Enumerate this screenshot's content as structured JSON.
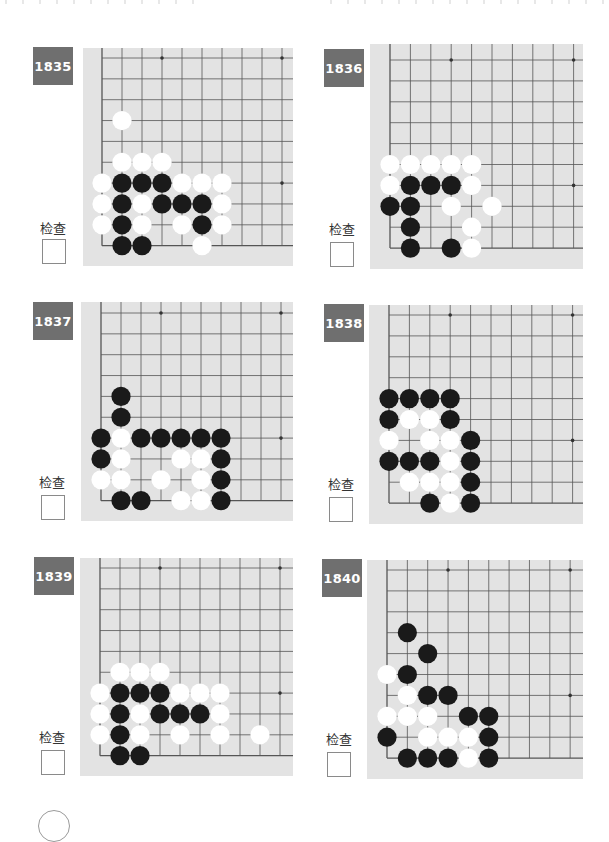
{
  "page": {
    "check_label": "检查",
    "colors": {
      "badge_bg": "#6f6f6f",
      "board_bg": "#e3e3e3",
      "grid_line": "#555555",
      "black_stone": "#1a1a1a",
      "white_stone": "#ffffff"
    }
  },
  "problems": [
    {
      "number": "1835",
      "check_label": "检查",
      "board": {
        "x": 83,
        "y": 48,
        "w": 210,
        "h": 218,
        "grid_left": 19,
        "grid_top": 10,
        "dx": 20,
        "dy": 20.85,
        "cols": 10,
        "rows": 10,
        "stars": [
          [
            3,
            0
          ],
          [
            9,
            0
          ],
          [
            9,
            6
          ]
        ]
      },
      "badge": {
        "x": 33,
        "y": 47
      },
      "label_pos": {
        "x": 33,
        "y": 218
      },
      "checkbox_pos": {
        "x": 42,
        "y": 239
      },
      "black": [
        [
          1,
          6
        ],
        [
          2,
          6
        ],
        [
          3,
          6
        ],
        [
          1,
          7
        ],
        [
          3,
          7
        ],
        [
          4,
          7
        ],
        [
          5,
          7
        ],
        [
          1,
          8
        ],
        [
          5,
          8
        ],
        [
          1,
          9
        ],
        [
          2,
          9
        ]
      ],
      "white": [
        [
          1,
          3
        ],
        [
          1,
          5
        ],
        [
          2,
          5
        ],
        [
          3,
          5
        ],
        [
          0,
          6
        ],
        [
          4,
          6
        ],
        [
          5,
          6
        ],
        [
          6,
          6
        ],
        [
          0,
          7
        ],
        [
          2,
          7
        ],
        [
          6,
          7
        ],
        [
          0,
          8
        ],
        [
          2,
          8
        ],
        [
          4,
          8
        ],
        [
          6,
          8
        ],
        [
          5,
          9
        ]
      ]
    },
    {
      "number": "1836",
      "check_label": "检查",
      "board": {
        "x": 370,
        "y": 44,
        "w": 213,
        "h": 225,
        "grid_left": 20,
        "grid_top": 16,
        "dx": 20.4,
        "dy": 20.9,
        "cols": 10,
        "rows": 10,
        "stars": [
          [
            3,
            0
          ],
          [
            9,
            0
          ],
          [
            9,
            6
          ]
        ]
      },
      "badge": {
        "x": 324,
        "y": 49
      },
      "label_pos": {
        "x": 322,
        "y": 219
      },
      "checkbox_pos": {
        "x": 330,
        "y": 242
      },
      "black": [
        [
          1,
          6
        ],
        [
          2,
          6
        ],
        [
          3,
          6
        ],
        [
          0,
          7
        ],
        [
          1,
          7
        ],
        [
          1,
          8
        ],
        [
          1,
          9
        ],
        [
          3,
          9
        ]
      ],
      "white": [
        [
          0,
          5
        ],
        [
          1,
          5
        ],
        [
          2,
          5
        ],
        [
          3,
          5
        ],
        [
          4,
          5
        ],
        [
          0,
          6
        ],
        [
          4,
          6
        ],
        [
          3,
          7
        ],
        [
          5,
          7
        ],
        [
          4,
          8
        ],
        [
          4,
          9
        ]
      ]
    },
    {
      "number": "1837",
      "check_label": "检查",
      "board": {
        "x": 81,
        "y": 302,
        "w": 212,
        "h": 219,
        "grid_left": 20,
        "grid_top": 11,
        "dx": 20,
        "dy": 20.85,
        "cols": 10,
        "rows": 10,
        "stars": [
          [
            3,
            0
          ],
          [
            9,
            0
          ],
          [
            9,
            6
          ]
        ]
      },
      "badge": {
        "x": 33,
        "y": 302
      },
      "label_pos": {
        "x": 32,
        "y": 472
      },
      "checkbox_pos": {
        "x": 41,
        "y": 495
      },
      "black": [
        [
          1,
          4
        ],
        [
          1,
          5
        ],
        [
          0,
          6
        ],
        [
          2,
          6
        ],
        [
          3,
          6
        ],
        [
          4,
          6
        ],
        [
          5,
          6
        ],
        [
          6,
          6
        ],
        [
          0,
          7
        ],
        [
          6,
          7
        ],
        [
          6,
          8
        ],
        [
          1,
          9
        ],
        [
          2,
          9
        ],
        [
          6,
          9
        ]
      ],
      "white": [
        [
          1,
          6
        ],
        [
          1,
          7
        ],
        [
          4,
          7
        ],
        [
          5,
          7
        ],
        [
          0,
          8
        ],
        [
          1,
          8
        ],
        [
          3,
          8
        ],
        [
          5,
          8
        ],
        [
          4,
          9
        ],
        [
          5,
          9
        ]
      ]
    },
    {
      "number": "1838",
      "check_label": "检查",
      "board": {
        "x": 369,
        "y": 305,
        "w": 214,
        "h": 219,
        "grid_left": 20,
        "grid_top": 10,
        "dx": 20.4,
        "dy": 20.9,
        "cols": 10,
        "rows": 10,
        "stars": [
          [
            3,
            0
          ],
          [
            9,
            0
          ],
          [
            9,
            6
          ]
        ]
      },
      "badge": {
        "x": 324,
        "y": 304
      },
      "label_pos": {
        "x": 321,
        "y": 474
      },
      "checkbox_pos": {
        "x": 329,
        "y": 497
      },
      "black": [
        [
          0,
          4
        ],
        [
          1,
          4
        ],
        [
          2,
          4
        ],
        [
          3,
          4
        ],
        [
          0,
          5
        ],
        [
          3,
          5
        ],
        [
          4,
          6
        ],
        [
          0,
          7
        ],
        [
          1,
          7
        ],
        [
          2,
          7
        ],
        [
          4,
          7
        ],
        [
          4,
          8
        ],
        [
          2,
          9
        ],
        [
          4,
          9
        ]
      ],
      "white": [
        [
          1,
          5
        ],
        [
          2,
          5
        ],
        [
          0,
          6
        ],
        [
          2,
          6
        ],
        [
          3,
          6
        ],
        [
          3,
          7
        ],
        [
          1,
          8
        ],
        [
          2,
          8
        ],
        [
          3,
          8
        ],
        [
          3,
          9
        ]
      ]
    },
    {
      "number": "1839",
      "check_label": "检查",
      "board": {
        "x": 80,
        "y": 558,
        "w": 213,
        "h": 218,
        "grid_left": 20,
        "grid_top": 10,
        "dx": 20,
        "dy": 20.85,
        "cols": 10,
        "rows": 10,
        "stars": [
          [
            3,
            0
          ],
          [
            9,
            0
          ],
          [
            9,
            6
          ]
        ]
      },
      "badge": {
        "x": 34,
        "y": 557
      },
      "label_pos": {
        "x": 32,
        "y": 727
      },
      "checkbox_pos": {
        "x": 41,
        "y": 750
      },
      "black": [
        [
          1,
          6
        ],
        [
          2,
          6
        ],
        [
          3,
          6
        ],
        [
          1,
          7
        ],
        [
          3,
          7
        ],
        [
          4,
          7
        ],
        [
          5,
          7
        ],
        [
          1,
          8
        ],
        [
          1,
          9
        ],
        [
          2,
          9
        ]
      ],
      "white": [
        [
          1,
          5
        ],
        [
          2,
          5
        ],
        [
          3,
          5
        ],
        [
          0,
          6
        ],
        [
          4,
          6
        ],
        [
          5,
          6
        ],
        [
          6,
          6
        ],
        [
          0,
          7
        ],
        [
          2,
          7
        ],
        [
          6,
          7
        ],
        [
          0,
          8
        ],
        [
          2,
          8
        ],
        [
          4,
          8
        ],
        [
          6,
          8
        ],
        [
          8,
          8
        ]
      ]
    },
    {
      "number": "1840",
      "check_label": "检查",
      "board": {
        "x": 367,
        "y": 560,
        "w": 216,
        "h": 219,
        "grid_left": 20,
        "grid_top": 10,
        "dx": 20.35,
        "dy": 20.9,
        "cols": 10,
        "rows": 10,
        "stars": [
          [
            3,
            0
          ],
          [
            9,
            0
          ],
          [
            9,
            6
          ]
        ]
      },
      "badge": {
        "x": 322,
        "y": 559
      },
      "label_pos": {
        "x": 319,
        "y": 729
      },
      "checkbox_pos": {
        "x": 327,
        "y": 752
      },
      "black": [
        [
          1,
          3
        ],
        [
          2,
          4
        ],
        [
          1,
          5
        ],
        [
          2,
          6
        ],
        [
          3,
          6
        ],
        [
          4,
          7
        ],
        [
          5,
          7
        ],
        [
          0,
          8
        ],
        [
          5,
          8
        ],
        [
          1,
          9
        ],
        [
          2,
          9
        ],
        [
          3,
          9
        ],
        [
          5,
          9
        ]
      ],
      "white": [
        [
          0,
          5
        ],
        [
          1,
          6
        ],
        [
          0,
          7
        ],
        [
          1,
          7
        ],
        [
          2,
          7
        ],
        [
          2,
          8
        ],
        [
          3,
          8
        ],
        [
          4,
          8
        ],
        [
          4,
          9
        ]
      ]
    }
  ]
}
